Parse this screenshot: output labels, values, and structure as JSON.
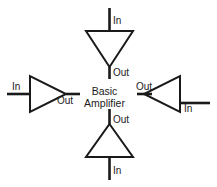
{
  "figure": {
    "center_label": {
      "line1": "Basic",
      "line2": "Amplifier"
    },
    "stroke_color": "#1a1a1a",
    "background_color": "#ffffff",
    "amplifiers": [
      {
        "id": "top",
        "orientation": "points-down",
        "input_label": "In",
        "input_position": "top",
        "output_label": "Out",
        "output_position": "bottom"
      },
      {
        "id": "left",
        "orientation": "points-right",
        "input_label": "In",
        "input_position": "left",
        "output_label": "Out",
        "output_position": "right"
      },
      {
        "id": "right",
        "orientation": "points-left",
        "input_label": "In",
        "input_position": "right",
        "output_label": "Out",
        "output_position": "left"
      },
      {
        "id": "bottom",
        "orientation": "points-up",
        "input_label": "In",
        "input_position": "bottom",
        "output_label": "Out",
        "output_position": "top"
      }
    ]
  }
}
